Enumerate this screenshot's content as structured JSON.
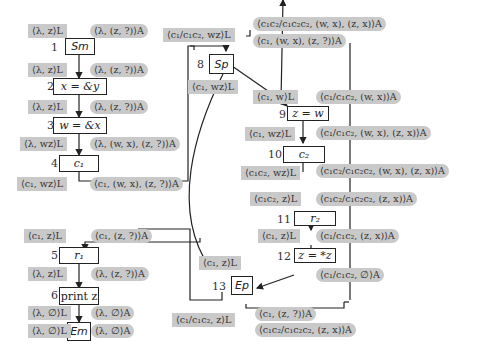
{
  "diagram": {
    "type": "control-flow-graph",
    "nodes": [
      {
        "id": 1,
        "label": "S_m",
        "text": "Sm"
      },
      {
        "id": 2,
        "label": "x = &y",
        "text": "x = &y"
      },
      {
        "id": 3,
        "label": "w = &x",
        "text": "w = &x"
      },
      {
        "id": 4,
        "label": "c1",
        "text": "c₁"
      },
      {
        "id": 5,
        "label": "r1",
        "text": "r₁"
      },
      {
        "id": 6,
        "label": "print z",
        "text": "print z"
      },
      {
        "id": 7,
        "label": "E_m",
        "text": "Em"
      },
      {
        "id": 8,
        "label": "S_p",
        "text": "Sp"
      },
      {
        "id": 9,
        "label": "z = w",
        "text": "z = w"
      },
      {
        "id": 10,
        "label": "c2",
        "text": "c₂"
      },
      {
        "id": 11,
        "label": "r2",
        "text": "r₂"
      },
      {
        "id": 12,
        "label": "z = *z",
        "text": "z = *z"
      },
      {
        "id": 13,
        "label": "E_p",
        "text": "Ep"
      }
    ],
    "numbers": [
      "1",
      "2",
      "3",
      "4",
      "5",
      "6",
      "7",
      "8",
      "9",
      "10",
      "11",
      "12",
      "13"
    ],
    "labels": {
      "l1_L": "⟨λ, z⟩L",
      "l1_A": "⟨λ, (z, ?)⟩A",
      "l2_L": "⟨λ, z⟩L",
      "l2_A": "⟨λ, (z, ?)⟩A",
      "l3_L": "⟨λ, z⟩L",
      "l3_A": "⟨λ, (z, ?)⟩A",
      "l4_L": "⟨λ, wz⟩L",
      "l4_A": "⟨λ, (w, x), (z, ?)⟩A",
      "l5_L": "⟨c₁, wz⟩L",
      "l5_A": "⟨c₁, (w, x), (z, ?)⟩A",
      "l6_L": "⟨c₁, z⟩L",
      "l6_A": "⟨c₁, (z, ?)⟩A",
      "l7_L": "⟨λ, z⟩L",
      "l7_A": "⟨λ, (z, ?)⟩A",
      "l8_L": "⟨λ, ∅⟩L",
      "l8_A": "⟨λ, ∅⟩A",
      "l9_L": "⟨λ, ∅⟩L",
      "l9_A": "⟨λ, ∅⟩A",
      "p_in_L": "⟨c₁/c₁c₂, wz⟩L",
      "p_in_A1": "⟨c₁c₂/c₁c₂c₂, (w, x), (z, x)⟩A",
      "p_in_A2": "⟨c₁, (w, x), (z, ?)⟩A",
      "p8_L": "⟨c₁, wz⟩L",
      "p9_L": "⟨c₁, w⟩L",
      "p9_A": "⟨c₁/c₁c₂, (w, x)⟩A",
      "p10_L": "⟨c₁, wz⟩L",
      "p10_A": "⟨c₁/c₁c₂, (w, x), (z, x)⟩A",
      "p10o_L": "⟨c₁c₂, wz⟩L",
      "p10o_A": "⟨c₁c₂/c₁c₂c₂, (w, x), (z, x)⟩A",
      "p11_L": "⟨c₁c₂, z⟩L",
      "p11_A": "⟨c₁c₂/c₁c₂c₂, (z, x)⟩A",
      "p12_L": "⟨c₁, z⟩L",
      "p12_A": "⟨c₁/c₁c₂, (z, x)⟩A",
      "p12o_A": "⟨c₁/c₁c₂, ∅⟩A",
      "p13_L": "⟨c₁, z⟩L",
      "p13o_L": "⟨c₁/c₁c₂, z⟩L",
      "p13o_A1": "⟨c₁, (z, ?)⟩A",
      "p13o_A2": "⟨c₁c₂/c₁c₂c₂, (z, x)⟩A"
    }
  }
}
